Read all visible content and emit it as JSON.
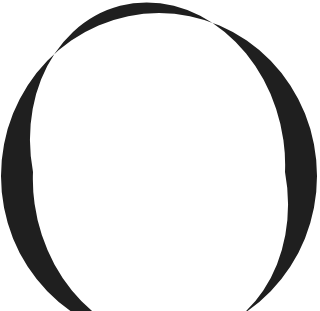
{
  "image": {
    "glyph": "O",
    "description": "Large serif capital letter O, cropped at bottom",
    "colors": {
      "ink": "#1f1f1f",
      "background": "#ffffff"
    }
  }
}
